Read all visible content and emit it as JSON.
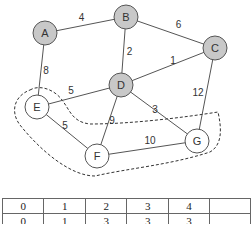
{
  "graph": {
    "nodes": [
      {
        "id": "A",
        "label": "A",
        "fill": "#c8c8c8"
      },
      {
        "id": "B",
        "label": "B",
        "fill": "#c8c8c8"
      },
      {
        "id": "C",
        "label": "C",
        "fill": "#c8c8c8"
      },
      {
        "id": "D",
        "label": "D",
        "fill": "#c8c8c8"
      },
      {
        "id": "E",
        "label": "E",
        "fill": "#ffffff"
      },
      {
        "id": "F",
        "label": "F",
        "fill": "#ffffff"
      },
      {
        "id": "G",
        "label": "G",
        "fill": "#ffffff"
      }
    ],
    "edges": [
      {
        "from": "A",
        "to": "B",
        "weight": "4"
      },
      {
        "from": "B",
        "to": "C",
        "weight": "6"
      },
      {
        "from": "A",
        "to": "E",
        "weight": "8"
      },
      {
        "from": "B",
        "to": "D",
        "weight": "2"
      },
      {
        "from": "D",
        "to": "C",
        "weight": "1"
      },
      {
        "from": "E",
        "to": "D",
        "weight": "5"
      },
      {
        "from": "D",
        "to": "G",
        "weight": "3"
      },
      {
        "from": "C",
        "to": "G",
        "weight": "12"
      },
      {
        "from": "D",
        "to": "F",
        "weight": "9"
      },
      {
        "from": "E",
        "to": "F",
        "weight": "5"
      },
      {
        "from": "F",
        "to": "G",
        "weight": "10"
      }
    ],
    "highlighted_region": [
      "E",
      "F",
      "G"
    ]
  },
  "table": {
    "rows": [
      [
        "0",
        "1",
        "2",
        "3",
        "4",
        ""
      ],
      [
        "0",
        "1",
        "3",
        "3",
        "3",
        ""
      ]
    ]
  }
}
